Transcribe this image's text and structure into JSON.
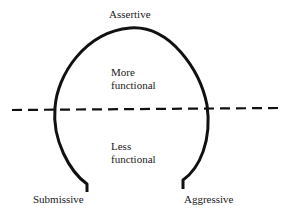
{
  "diagram": {
    "labels": {
      "top": "Assertive",
      "upper_region_line1": "More",
      "upper_region_line2": "functional",
      "lower_region_line1": "Less",
      "lower_region_line2": "functional",
      "bottom_left": "Submissive",
      "bottom_right": "Aggressive"
    },
    "colors": {
      "line": "#111111",
      "background": "#ffffff"
    }
  }
}
